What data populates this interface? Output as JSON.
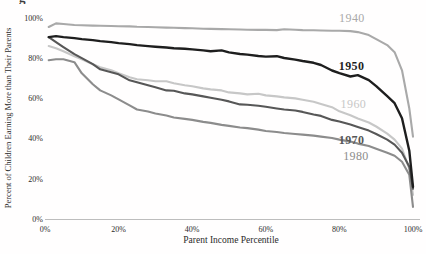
{
  "fragments": {
    "caption_descender": "g"
  },
  "chart_data": {
    "type": "line",
    "title": "",
    "xlabel": "Parent Income Percentile",
    "ylabel": "Percent of Children Earning More than Their Parents",
    "xlim": [
      0,
      100
    ],
    "ylim": [
      0,
      100
    ],
    "grid": false,
    "legend": "inline-labels-right",
    "axis_color": "#b5b5b5",
    "x_ticks": [
      {
        "v": 0,
        "label": "0%"
      },
      {
        "v": 20,
        "label": "20%"
      },
      {
        "v": 40,
        "label": "40%"
      },
      {
        "v": 60,
        "label": "60%"
      },
      {
        "v": 80,
        "label": "80%"
      },
      {
        "v": 100,
        "label": "100%"
      }
    ],
    "y_ticks": [
      {
        "v": 0,
        "label": "0%"
      },
      {
        "v": 20,
        "label": "20%"
      },
      {
        "v": 40,
        "label": "40%"
      },
      {
        "v": 60,
        "label": "60%"
      },
      {
        "v": 80,
        "label": "80%"
      },
      {
        "v": 100,
        "label": "100%"
      }
    ],
    "x": [
      1,
      3,
      5,
      8,
      10,
      13,
      15,
      18,
      20,
      23,
      25,
      28,
      30,
      33,
      35,
      38,
      40,
      43,
      45,
      48,
      50,
      53,
      55,
      58,
      60,
      63,
      65,
      68,
      70,
      73,
      75,
      78,
      80,
      83,
      85,
      88,
      90,
      93,
      95,
      97,
      99,
      100
    ],
    "series": [
      {
        "name": "1940",
        "color": "#a9a9a9",
        "stroke_width": 2.1,
        "bold_label": false,
        "label_p": 83.4,
        "label_v": 98,
        "values": [
          95.5,
          97.3,
          97,
          96.5,
          96.4,
          96.2,
          96.1,
          96,
          95.9,
          95.8,
          95.6,
          95.5,
          95.4,
          95.2,
          95.1,
          95,
          94.9,
          94.7,
          94.6,
          94.5,
          94.4,
          94.3,
          94.2,
          94.1,
          94.1,
          94,
          94.4,
          94.2,
          94,
          93.9,
          93.8,
          93.7,
          93.7,
          93.5,
          93,
          91.5,
          89.5,
          86.5,
          83,
          74,
          55,
          41
        ]
      },
      {
        "name": "1960",
        "color": "#c7c7c7",
        "stroke_width": 2.1,
        "bold_label": false,
        "label_p": 83.8,
        "label_v": 55.2,
        "values": [
          86,
          85,
          83.5,
          81,
          79.5,
          77,
          75.5,
          74,
          72.5,
          70.5,
          69.5,
          69,
          68.5,
          68.5,
          67.5,
          66.5,
          66,
          65,
          64.5,
          64,
          63,
          62.5,
          62,
          62.3,
          61.5,
          61,
          60.5,
          60,
          59.3,
          58.3,
          57.2,
          55.6,
          53.6,
          51.6,
          50,
          48,
          46,
          42.5,
          39.5,
          35,
          25,
          12
        ]
      },
      {
        "name": "1980",
        "color": "#8c8c8c",
        "stroke_width": 2.1,
        "bold_label": false,
        "label_p": 84.5,
        "label_v": 29.6,
        "values": [
          79,
          79.5,
          79.5,
          78,
          72.5,
          67,
          64,
          61.5,
          59.5,
          56.5,
          54.5,
          53.5,
          52.5,
          51.5,
          50.5,
          49.8,
          49.3,
          48.3,
          47.8,
          46.8,
          46.3,
          45.5,
          45.2,
          44.5,
          43.8,
          43.3,
          42.8,
          42.3,
          42,
          41.5,
          41,
          40.3,
          39.5,
          38.5,
          37.5,
          36.3,
          35,
          33,
          31.5,
          28.5,
          22,
          6
        ]
      },
      {
        "name": "1970",
        "color": "#575757",
        "stroke_width": 2.1,
        "bold_label": true,
        "label_p": 83.3,
        "label_v": 37.3,
        "values": [
          90.5,
          88,
          85.5,
          82,
          80,
          77,
          74.5,
          73,
          72,
          69,
          68,
          66.5,
          65.5,
          64,
          63.8,
          62.5,
          62,
          61,
          60.3,
          59.3,
          58.5,
          57,
          56.8,
          56.3,
          55.8,
          55,
          54.5,
          54,
          53.3,
          52,
          51.3,
          49.3,
          48.5,
          47,
          45.8,
          44,
          42.3,
          39.5,
          37,
          33,
          26,
          15
        ]
      },
      {
        "name": "1950",
        "color": "#1e1e1e",
        "stroke_width": 2.4,
        "bold_label": true,
        "label_p": 83.3,
        "label_v": 73.9,
        "values": [
          90.5,
          91,
          90.5,
          90,
          89.5,
          89,
          88.5,
          88,
          87.5,
          87,
          86.5,
          86,
          85.7,
          85.3,
          85,
          84.7,
          84.4,
          83.9,
          83.5,
          83.9,
          82.9,
          82.1,
          81.8,
          81.1,
          80.8,
          81,
          80.1,
          79.3,
          78.6,
          77.7,
          76.6,
          73.9,
          72.6,
          70.9,
          71.6,
          69.1,
          66.1,
          61.1,
          57.6,
          50.1,
          34,
          16
        ]
      }
    ]
  }
}
